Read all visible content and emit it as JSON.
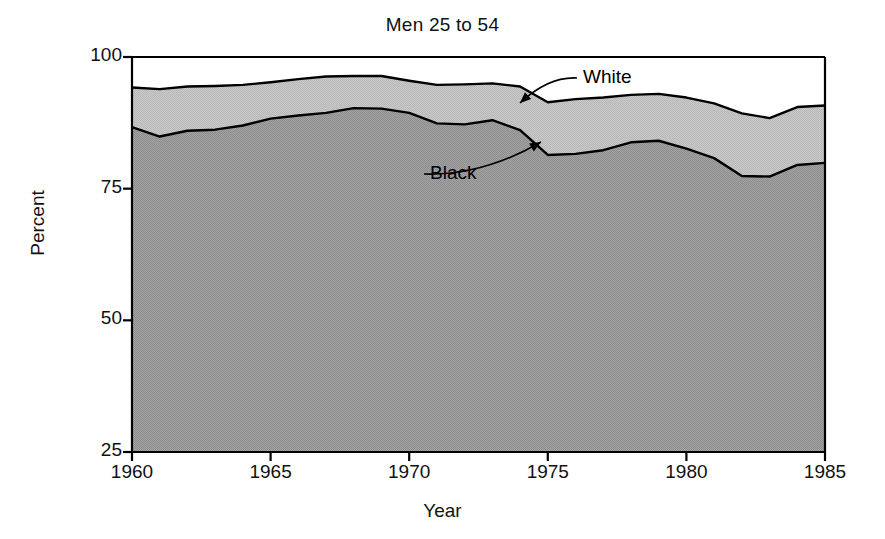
{
  "chart_data": {
    "type": "area",
    "title": "Men 25 to 54",
    "xlabel": "Year",
    "ylabel": "Percent",
    "xlim": [
      1960,
      1985
    ],
    "ylim": [
      25,
      100
    ],
    "grid": false,
    "legend_position": "inline-annotations",
    "xticks": [
      "1960",
      "1965",
      "1970",
      "1975",
      "1980",
      "1985"
    ],
    "xtick_values": [
      1960,
      1965,
      1970,
      1975,
      1980,
      1985
    ],
    "yticks": [
      "25",
      "50",
      "75",
      "100"
    ],
    "ytick_values": [
      25,
      50,
      75,
      100
    ],
    "x": [
      1960,
      1961,
      1962,
      1963,
      1964,
      1965,
      1966,
      1967,
      1968,
      1969,
      1970,
      1971,
      1972,
      1973,
      1974,
      1975,
      1976,
      1977,
      1978,
      1979,
      1980,
      1981,
      1982,
      1983,
      1984,
      1985
    ],
    "series": [
      {
        "name": "White",
        "annotation": "White",
        "fill_color": "#c4c4c4",
        "line_color": "#000000",
        "values": [
          94.2,
          93.9,
          94.4,
          94.5,
          94.7,
          95.2,
          95.8,
          96.3,
          96.4,
          96.4,
          95.5,
          94.7,
          94.8,
          95.0,
          94.4,
          91.4,
          92.0,
          92.3,
          92.8,
          93.0,
          92.3,
          91.2,
          89.3,
          88.4,
          90.5,
          90.8
        ]
      },
      {
        "name": "Black",
        "annotation": "Black",
        "fill_color": "#9a9a9a",
        "line_color": "#000000",
        "values": [
          86.7,
          84.9,
          86.0,
          86.2,
          87.0,
          88.3,
          88.9,
          89.4,
          90.3,
          90.2,
          89.4,
          87.4,
          87.2,
          88.0,
          86.1,
          81.4,
          81.6,
          82.3,
          83.8,
          84.1,
          82.6,
          80.8,
          77.4,
          77.3,
          79.5,
          79.9
        ]
      }
    ],
    "annotations": [
      {
        "text": "White",
        "label_x": 583,
        "label_y": 66,
        "arrow_tip_x": 520,
        "arrow_tip_y": 103
      },
      {
        "text": "Black",
        "label_x": 430,
        "label_y": 162,
        "arrow_tip_x": 541,
        "arrow_tip_y": 142
      }
    ]
  }
}
